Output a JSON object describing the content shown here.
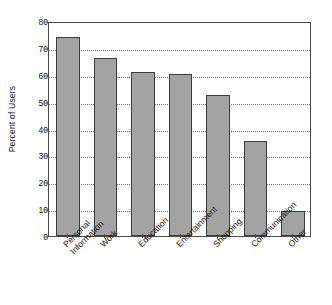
{
  "chart_data": {
    "type": "bar",
    "title": "",
    "subtitle": "",
    "xlabel": "",
    "ylabel": "Percent of Users",
    "ylim": [
      0,
      80
    ],
    "ytick_step": 10,
    "yticks": [
      0,
      10,
      20,
      30,
      40,
      50,
      60,
      70,
      80
    ],
    "ytick_labels": [
      "0",
      "10",
      "20",
      "30",
      "40",
      "50",
      "60",
      "70",
      "80"
    ],
    "grid": true,
    "grid_axis": "y",
    "grid_style": "dotted",
    "legend": false,
    "legend_position": "none",
    "orientation": "vertical",
    "categories": [
      "Personal\nInformation",
      "Work",
      "Education",
      "Entertainment",
      "Shopping",
      "Communication",
      "Other"
    ],
    "category_labels_rotation": -45,
    "values": [
      74.2,
      66.2,
      61.2,
      60.1,
      52.3,
      35.4,
      9.3
    ],
    "colors": {
      "bar_fill": "#a3a3a3",
      "bar_edge": "#3d3d3d",
      "axis": "#4a4a4a",
      "grid": "#777777",
      "text": "#141414",
      "background": "#ffffff"
    }
  }
}
